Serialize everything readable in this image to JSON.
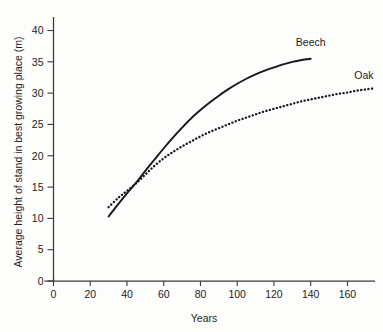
{
  "chart_data": {
    "type": "line",
    "title": "",
    "xlabel": "Years",
    "ylabel": "Average height of stand in best growing place (m)",
    "xlim": [
      0,
      175
    ],
    "ylim": [
      0,
      42
    ],
    "xticks": [
      0,
      20,
      40,
      60,
      80,
      100,
      120,
      140,
      160
    ],
    "yticks": [
      0,
      5,
      10,
      15,
      20,
      25,
      30,
      35,
      40
    ],
    "grid": false,
    "legend_position": "inline-end-of-line",
    "series": [
      {
        "name": "Beech",
        "style": "solid",
        "label_x": 140,
        "label_y": 37.5,
        "x": [
          30,
          35,
          40,
          45,
          50,
          55,
          60,
          65,
          70,
          75,
          80,
          85,
          90,
          95,
          100,
          105,
          110,
          115,
          120,
          125,
          130,
          135,
          140
        ],
        "y": [
          10.3,
          12.2,
          14.0,
          15.7,
          17.6,
          19.4,
          21.2,
          22.9,
          24.5,
          26.0,
          27.3,
          28.5,
          29.6,
          30.6,
          31.5,
          32.3,
          33.0,
          33.6,
          34.1,
          34.6,
          35.0,
          35.3,
          35.5
        ]
      },
      {
        "name": "Oak",
        "style": "dotted",
        "label_x": 169,
        "label_y": 32.2,
        "x": [
          30,
          35,
          40,
          45,
          50,
          55,
          60,
          65,
          70,
          75,
          80,
          85,
          90,
          95,
          100,
          105,
          110,
          115,
          120,
          125,
          130,
          135,
          140,
          145,
          150,
          155,
          160,
          165,
          170,
          175
        ],
        "y": [
          11.8,
          13.2,
          14.4,
          15.6,
          17.0,
          18.4,
          19.6,
          20.6,
          21.5,
          22.3,
          23.1,
          23.8,
          24.4,
          25.0,
          25.6,
          26.1,
          26.6,
          27.1,
          27.5,
          27.9,
          28.3,
          28.7,
          29.0,
          29.3,
          29.6,
          29.9,
          30.1,
          30.4,
          30.6,
          30.8
        ]
      }
    ]
  },
  "axes": {
    "x_title": "Years",
    "y_title": "Average height of stand in best growing place (m)",
    "x_tick_labels": [
      "0",
      "20",
      "40",
      "60",
      "80",
      "100",
      "120",
      "140",
      "160"
    ],
    "y_tick_labels": [
      "0",
      "5",
      "10",
      "15",
      "20",
      "25",
      "30",
      "35",
      "40"
    ]
  },
  "series_labels": {
    "beech": "Beech",
    "oak": "Oak"
  },
  "colors": {
    "ink": "#17171a",
    "axis": "#3a3a3a",
    "background": "#fdfdfc"
  }
}
